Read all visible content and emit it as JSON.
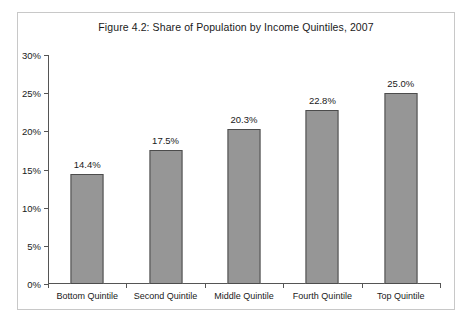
{
  "figure": {
    "title": "Figure 4.2: Share of Population by Income Quintiles, 2007"
  },
  "chart_data": {
    "type": "bar",
    "title": "Figure 4.2: Share of Population by Income Quintiles, 2007",
    "xlabel": "",
    "ylabel": "",
    "categories": [
      "Bottom Quintile",
      "Second Quintile",
      "Middle Quintile",
      "Fourth Quintile",
      "Top Quintile"
    ],
    "values": [
      14.4,
      17.5,
      20.3,
      22.8,
      25.0
    ],
    "value_labels": [
      "14.4%",
      "17.5%",
      "20.3%",
      "22.8%",
      "25.0%"
    ],
    "ylim": [
      0,
      30
    ],
    "ytick_values": [
      0,
      5,
      10,
      15,
      20,
      25,
      30
    ],
    "ytick_labels": [
      "0%",
      "5%",
      "10%",
      "15%",
      "20%",
      "25%",
      "30%"
    ],
    "grid": false,
    "legend": false,
    "bar_color": "#969696",
    "bar_border_color": "#4c4c4c",
    "axis_color": "#555555",
    "plot_background": "#ffffff",
    "frame_border_color": "#c8c8c8"
  }
}
